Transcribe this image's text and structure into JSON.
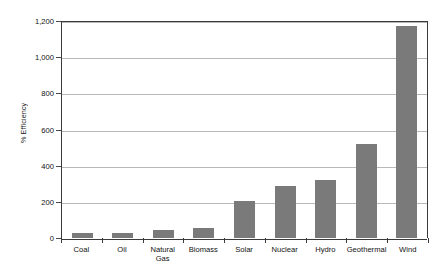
{
  "chart_data": {
    "type": "bar",
    "title": "",
    "subtitle": "",
    "xlabel": "",
    "ylabel": "% Efficiency",
    "categories": [
      "Coal",
      "Oil",
      "Natural Gas",
      "Biomass",
      "Solar",
      "Nuclear",
      "Hydro",
      "Geothermal",
      "Wind"
    ],
    "values": [
      28,
      30,
      42,
      55,
      205,
      285,
      320,
      520,
      1170
    ],
    "series": [
      {
        "name": "% Efficiency",
        "values": [
          28,
          30,
          42,
          55,
          205,
          285,
          320,
          520,
          1170
        ]
      }
    ],
    "ylim": [
      0,
      1200
    ],
    "ytick_step": 200,
    "ytick_values": [
      0,
      200,
      400,
      600,
      800,
      1000,
      1200
    ],
    "ytick_labels": [
      "0",
      "200",
      "400",
      "600",
      "800",
      "1,000",
      "1,200"
    ],
    "grid": true,
    "grid_axis": "y",
    "legend": false,
    "legend_position": "none",
    "annotations": [],
    "bar_color": "#7a7a7a",
    "gridline_color": "#b8b8b8",
    "axis_color": "#3a3a3a",
    "background_color": "#ffffff",
    "text_color": "#111111"
  }
}
